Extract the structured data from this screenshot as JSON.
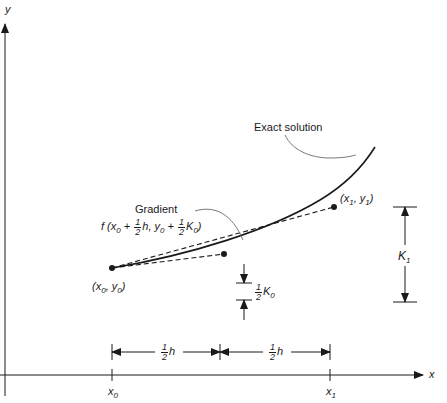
{
  "diagram": {
    "axes": {
      "x_label": "x",
      "y_label": "y"
    },
    "curve_label": "Exact solution",
    "gradient_label": {
      "title": "Gradient",
      "formula_prefix": "f (x",
      "formula_x_sub": "0",
      "formula_plus1": " + ",
      "formula_frac_num": "1",
      "formula_frac_den": "2",
      "formula_h": "h",
      "formula_comma": ", y",
      "formula_y_sub": "0",
      "formula_plus2": " + ",
      "formula_frac2_num": "1",
      "formula_frac2_den": "2",
      "formula_K": "K",
      "formula_K_sub": "0",
      "formula_close": ")"
    },
    "points": {
      "start": {
        "label_open": "(x",
        "x_sub": "0",
        "mid": ", y",
        "y_sub": "0",
        "close": ")"
      },
      "end": {
        "label_open": "(x",
        "x_sub": "1",
        "mid": ", y",
        "y_sub": "1",
        "close": ")"
      }
    },
    "half_k0": {
      "num": "1",
      "den": "2",
      "sym": "K",
      "sub": "0"
    },
    "k1": {
      "sym": "K",
      "sub": "1"
    },
    "half_h": [
      {
        "num": "1",
        "den": "2",
        "sym": "h"
      },
      {
        "num": "1",
        "den": "2",
        "sym": "h"
      }
    ],
    "ticks": {
      "x0": {
        "sym": "x",
        "sub": "0"
      },
      "x1": {
        "sym": "x",
        "sub": "1"
      }
    },
    "colors": {
      "ink": "#1a1a1a",
      "leader": "#777777"
    }
  }
}
